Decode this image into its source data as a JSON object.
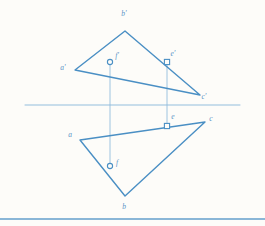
{
  "figure": {
    "colors": {
      "stroke": "#4a8fc4",
      "stroke_light": "#8fbcdd",
      "label": "#5a93c6",
      "paper": "#fdfcf9"
    },
    "ground_line": {
      "name": "ground-line",
      "x1": 25,
      "y1": 105,
      "x2": 240,
      "y2": 105
    },
    "bottom_rule": {
      "name": "bottom-rule",
      "x1": 0,
      "y1": 219,
      "x2": 265,
      "y2": 219
    },
    "top_view": {
      "name": "frontal-projection",
      "vertices": [
        {
          "id": "a-prime",
          "label": "a'",
          "x": 75,
          "y": 70,
          "label_x": 63,
          "label_y": 70
        },
        {
          "id": "b-prime",
          "label": "b'",
          "x": 125,
          "y": 31,
          "label_x": 124,
          "label_y": 16
        },
        {
          "id": "c-prime",
          "label": "c'",
          "x": 200,
          "y": 95,
          "label_x": 204,
          "label_y": 99
        }
      ]
    },
    "bottom_view": {
      "name": "horizontal-projection",
      "vertices": [
        {
          "id": "a",
          "label": "a",
          "x": 80,
          "y": 140,
          "label_x": 70,
          "label_y": 137
        },
        {
          "id": "b",
          "label": "b",
          "x": 125,
          "y": 196,
          "label_x": 124,
          "label_y": 209
        },
        {
          "id": "c",
          "label": "c",
          "x": 205,
          "y": 122,
          "label_x": 211,
          "label_y": 121
        }
      ]
    },
    "points": [
      {
        "id": "e-prime",
        "label": "e'",
        "x": 167,
        "y": 62,
        "label_x": 173,
        "label_y": 56,
        "marker": "square"
      },
      {
        "id": "f-prime",
        "label": "f'",
        "x": 110,
        "y": 62,
        "label_x": 117,
        "label_y": 58,
        "marker": "circle"
      },
      {
        "id": "e",
        "label": "e",
        "x": 167,
        "y": 126,
        "label_x": 173,
        "label_y": 119,
        "marker": "square"
      },
      {
        "id": "f",
        "label": "f",
        "x": 110,
        "y": 166,
        "label_x": 117,
        "label_y": 165,
        "marker": "circle"
      }
    ],
    "projectors": [
      {
        "id": "projector-f",
        "x": 110,
        "y1": 62,
        "y2": 166
      },
      {
        "id": "projector-e",
        "x": 167,
        "y1": 62,
        "y2": 126
      }
    ]
  }
}
